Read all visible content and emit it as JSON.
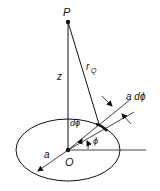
{
  "diagram": {
    "labels": {
      "point_p": "P",
      "origin": "O",
      "height": "z",
      "distance": "r",
      "distance_sub": "Q",
      "arc_length": "a dϕ",
      "d_angle": "dϕ",
      "angle": "ϕ",
      "radius": "a"
    },
    "colors": {
      "stroke": "#111111",
      "background": "#ffffff"
    }
  }
}
